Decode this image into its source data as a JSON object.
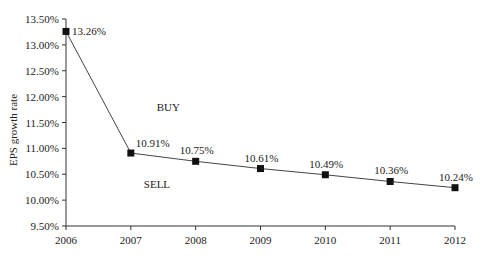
{
  "chart_data": {
    "type": "line",
    "title": "",
    "xlabel": "",
    "ylabel": "EPS growth rate",
    "categories": [
      "2006",
      "2007",
      "2008",
      "2009",
      "2010",
      "2011",
      "2012"
    ],
    "series": [
      {
        "name": "EPS growth rate",
        "values": [
          13.26,
          10.91,
          10.75,
          10.61,
          10.49,
          10.36,
          10.24
        ],
        "labels": [
          "13.26%",
          "10.91%",
          "10.75%",
          "10.61%",
          "10.49%",
          "10.36%",
          "10.24%"
        ],
        "marker": "square",
        "color": "#222222"
      }
    ],
    "ylim": [
      9.5,
      13.5
    ],
    "yticks": [
      9.5,
      10.0,
      10.5,
      11.0,
      11.5,
      12.0,
      12.5,
      13.0,
      13.5
    ],
    "ytick_labels": [
      "9.50%",
      "10.00%",
      "10.50%",
      "11.00%",
      "11.50%",
      "12.00%",
      "12.50%",
      "13.00%",
      "13.50%"
    ],
    "grid": false,
    "legend": null,
    "annotations": [
      {
        "text": "BUY",
        "x": 2007.4,
        "y": 11.72
      },
      {
        "text": "SELL",
        "x": 2007.2,
        "y": 10.24
      }
    ]
  }
}
